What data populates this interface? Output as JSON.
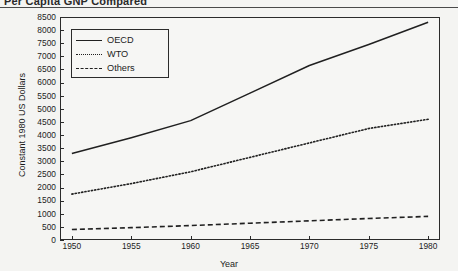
{
  "header": {
    "title": "Per Capita GNP Compared"
  },
  "legend": {
    "entries": [
      {
        "label": "OECD",
        "style": "solid"
      },
      {
        "label": "WTO",
        "style": "dotted"
      },
      {
        "label": "Others",
        "style": "dashed"
      }
    ]
  },
  "chart_data": {
    "type": "line",
    "title": "Per Capita GNP Compared",
    "xlabel": "Year",
    "ylabel": "Constant 1980 US Dollars",
    "xlim": [
      1949,
      1981
    ],
    "ylim": [
      0,
      8500
    ],
    "grid": false,
    "legend_position": "top-left",
    "xticks": [
      1950,
      1955,
      1960,
      1965,
      1970,
      1975,
      1980
    ],
    "yticks": [
      0,
      500,
      1000,
      1500,
      2000,
      2500,
      3000,
      3500,
      4000,
      4500,
      5000,
      5500,
      6000,
      6500,
      7000,
      7500,
      8000,
      8500
    ],
    "x": [
      1950,
      1955,
      1960,
      1965,
      1970,
      1975,
      1980
    ],
    "series": [
      {
        "name": "OECD",
        "style": "solid",
        "values": [
          3300,
          3900,
          4550,
          5600,
          6650,
          7450,
          8300
        ]
      },
      {
        "name": "WTO",
        "style": "dotted",
        "values": [
          1750,
          2150,
          2600,
          3150,
          3700,
          4250,
          4600
        ]
      },
      {
        "name": "Others",
        "style": "dashed",
        "values": [
          400,
          470,
          550,
          640,
          730,
          820,
          900
        ]
      }
    ]
  }
}
